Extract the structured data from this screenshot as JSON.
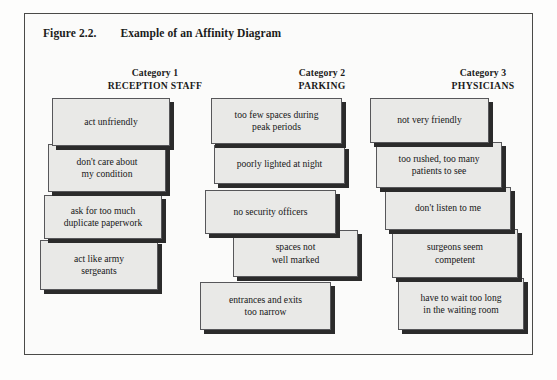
{
  "figure": {
    "label": "Figure 2.2.",
    "title": "Example of an Affinity Diagram",
    "title_line": "Figure 2.2.        Example of an Affinity Diagram"
  },
  "columns": [
    {
      "category_label": "Category 1",
      "category_name": "RECEPTION STAFF",
      "cards": [
        {
          "text": "act unfriendly"
        },
        {
          "text": "don't care about\nmy condition"
        },
        {
          "text": "ask for too much\nduplicate paperwork"
        },
        {
          "text": "act like army\nsergeants"
        }
      ]
    },
    {
      "category_label": "Category 2",
      "category_name": "PARKING",
      "cards": [
        {
          "text": "too few spaces during\npeak periods"
        },
        {
          "text": "poorly lighted at night"
        },
        {
          "text": "no security officers"
        },
        {
          "text": "spaces not\nwell marked"
        },
        {
          "text": "entrances and exits\ntoo narrow"
        }
      ]
    },
    {
      "category_label": "Category 3",
      "category_name": "PHYSICIANS",
      "cards": [
        {
          "text": "not very friendly"
        },
        {
          "text": "too rushed, too many\npatients to see"
        },
        {
          "text": "don't listen to me"
        },
        {
          "text": "surgeons seem\ncompetent"
        },
        {
          "text": "have to wait too long\nin the waiting room"
        }
      ]
    }
  ],
  "colors": {
    "card_fill": "#e9e9e7",
    "card_border": "#57575a",
    "card_shadow": "#2b2b2b",
    "frame_border": "#4a4a48",
    "text": "#171717",
    "page_background": "#fdfdfc"
  }
}
